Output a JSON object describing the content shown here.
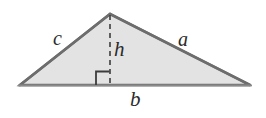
{
  "figure": {
    "kind": "geometry-diagram",
    "shape": "triangle",
    "labels": {
      "side_left": "c",
      "side_right": "a",
      "base": "b",
      "height": "h"
    },
    "colors": {
      "fill": "#e3e3e3",
      "outline": "#6d6d6d",
      "baseline": "#8a8a8a",
      "altitude": "#3c3c3c",
      "right_angle": "#3c3c3c",
      "label_text": "#2b2b2b",
      "background": "#ffffff"
    },
    "geometry": {
      "apex": [
        110,
        14
      ],
      "left_vertex": [
        20,
        85
      ],
      "right_vertex": [
        250,
        85
      ],
      "foot_of_altitude": [
        110,
        85
      ],
      "right_angle_size": 14,
      "altitude_dash": "5 4"
    }
  }
}
